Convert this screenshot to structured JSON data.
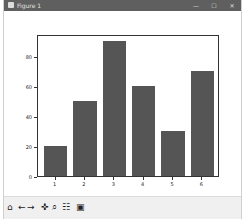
{
  "window": {
    "title": "Figure 1",
    "controls": {
      "minimize": "—",
      "maximize": "☐",
      "close": "✕"
    }
  },
  "toolbar": {
    "tools": [
      {
        "name": "home-icon",
        "glyph": "⌂"
      },
      {
        "name": "back-icon",
        "glyph": "←"
      },
      {
        "name": "forward-icon",
        "glyph": "→"
      },
      {
        "name": "pan-icon",
        "glyph": "✜"
      },
      {
        "name": "zoom-icon",
        "glyph": "⌕"
      },
      {
        "name": "configure-subplots-icon",
        "glyph": "☷"
      },
      {
        "name": "save-icon",
        "glyph": "▣"
      }
    ]
  },
  "chart_data": {
    "type": "bar",
    "categories": [
      "1",
      "2",
      "3",
      "4",
      "5",
      "6"
    ],
    "x": [
      1,
      2,
      3,
      4,
      5,
      6
    ],
    "values": [
      20,
      50,
      90,
      60,
      30,
      70
    ],
    "title": "",
    "xlabel": "",
    "ylabel": "",
    "yticks": [
      0,
      20,
      40,
      60,
      80
    ],
    "xticks": [
      1,
      2,
      3,
      4,
      5,
      6
    ],
    "ylim": [
      0,
      94.5
    ],
    "xlim": [
      0.4,
      6.6
    ],
    "bar_color": "#555555",
    "grid": false,
    "legend": null
  }
}
